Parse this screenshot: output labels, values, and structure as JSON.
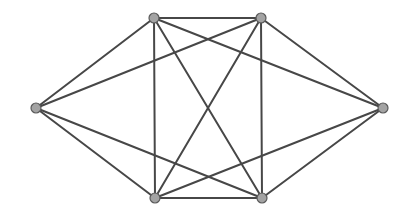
{
  "diagram": {
    "type": "graph",
    "directed": false,
    "colors": {
      "background": "#ffffff",
      "edge": "#474747",
      "node_fill": "#a3a3a3",
      "node_stroke": "#5a5a5a"
    },
    "edge_width": 2,
    "node_radius": 5,
    "nodes": [
      {
        "id": "left",
        "x": 36,
        "y": 108
      },
      {
        "id": "top-left",
        "x": 154,
        "y": 18
      },
      {
        "id": "top-right",
        "x": 261,
        "y": 18
      },
      {
        "id": "right",
        "x": 383,
        "y": 108
      },
      {
        "id": "bottom-left",
        "x": 155,
        "y": 198
      },
      {
        "id": "bottom-right",
        "x": 262,
        "y": 198
      }
    ],
    "edges": [
      [
        "left",
        "top-left"
      ],
      [
        "left",
        "top-right"
      ],
      [
        "left",
        "bottom-left"
      ],
      [
        "left",
        "bottom-right"
      ],
      [
        "right",
        "top-left"
      ],
      [
        "right",
        "top-right"
      ],
      [
        "right",
        "bottom-left"
      ],
      [
        "right",
        "bottom-right"
      ],
      [
        "top-left",
        "top-right"
      ],
      [
        "bottom-left",
        "bottom-right"
      ],
      [
        "top-left",
        "bottom-left"
      ],
      [
        "top-right",
        "bottom-right"
      ],
      [
        "top-left",
        "bottom-right"
      ],
      [
        "top-right",
        "bottom-left"
      ]
    ]
  }
}
